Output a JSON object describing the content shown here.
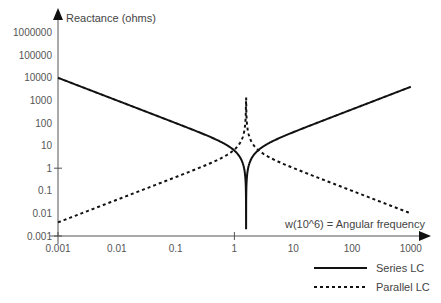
{
  "chart_data": {
    "type": "line",
    "title": "",
    "xlabel": "w(10^6) = Angular frequency",
    "ylabel": "Reactance (ohms)",
    "x_scale": "log",
    "y_scale": "log",
    "xlim": [
      0.001,
      1000
    ],
    "ylim": [
      0.001,
      1000000
    ],
    "grid": false,
    "legend_position": "bottom-right",
    "x_ticks": [
      "0.001",
      "0.01",
      "0.1",
      "1",
      "10",
      "100",
      "1000"
    ],
    "y_ticks": [
      "0.001",
      "0.01",
      "0.1",
      "1",
      "10",
      "100",
      "1000",
      "10000",
      "100000",
      "1000000"
    ],
    "resonance_w": 1.58,
    "series": [
      {
        "name": "Series LC",
        "style": "solid",
        "formula": "|w*L - 1/(w*C)|, L=4, 1/C=10",
        "L": 4,
        "invC": 10,
        "x": [
          0.001,
          0.01,
          0.1,
          1,
          1.58,
          10,
          100,
          1000
        ],
        "values": [
          10000,
          1000,
          100,
          6,
          0.001,
          39,
          400,
          4000
        ]
      },
      {
        "name": "Parallel LC",
        "style": "dashed",
        "formula": "w*L / |1 - w^2*L*C|, L=4, 1/C=10",
        "L": 4,
        "invC": 10,
        "x": [
          0.001,
          0.01,
          0.1,
          1,
          1.58,
          10,
          100,
          1000
        ],
        "values": [
          0.004,
          0.04,
          0.4,
          6.7,
          20000,
          1.0,
          0.1,
          0.01
        ]
      }
    ],
    "legend": [
      "Series LC",
      "Parallel LC"
    ]
  },
  "colors": {
    "axis": "#555555",
    "series": "#111111",
    "parallel": "#111111"
  }
}
